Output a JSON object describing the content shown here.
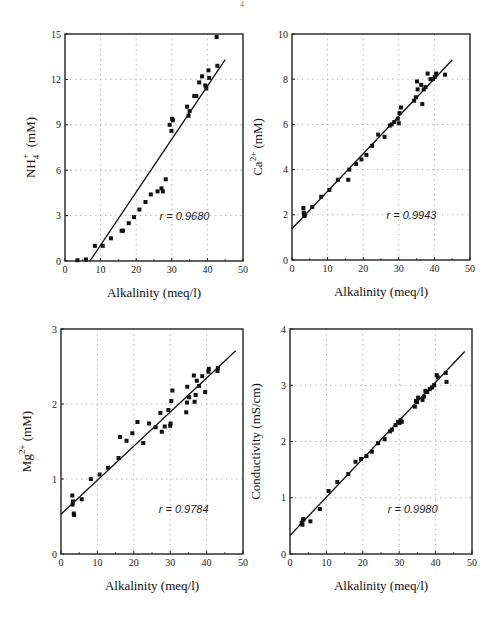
{
  "page_mark": "4",
  "chart_data": [
    {
      "id": "nh4",
      "type": "scatter",
      "title": "",
      "xlabel": "Alkalinity (meq/l)",
      "ylabel": "NH4+ (mM)",
      "ylabel_main": "NH",
      "ylabel_sub": "4",
      "ylabel_sup": "+",
      "ylabel_unit": "(mM)",
      "xlim": [
        0,
        50
      ],
      "ylim": [
        0,
        15
      ],
      "xticks": [
        0,
        10,
        20,
        30,
        40,
        50
      ],
      "yticks": [
        0,
        3,
        6,
        9,
        12,
        15
      ],
      "grid": true,
      "annotation": "r = 0.9680",
      "annotation_pos": [
        40,
        3
      ],
      "frame": {
        "left": 65,
        "top": 34,
        "right": 243,
        "bottom": 261
      },
      "fit_line": {
        "x": [
          7,
          45
        ],
        "y": [
          0,
          13.3
        ]
      },
      "x": [
        3.5,
        5.9,
        8.4,
        10.6,
        12.9,
        15.9,
        16.3,
        17.9,
        19.4,
        20.9,
        22.6,
        24.1,
        26.0,
        27.1,
        27.5,
        28.3,
        29.4,
        29.9,
        30.1,
        30.3,
        34.3,
        34.7,
        35.0,
        36.3,
        36.9,
        37.7,
        38.5,
        39.4,
        39.7,
        40.3,
        40.5,
        42.6,
        42.8
      ],
      "y": [
        0.05,
        0.1,
        1.0,
        1.0,
        1.5,
        2.0,
        2.0,
        2.5,
        2.9,
        3.4,
        3.9,
        4.4,
        4.6,
        4.8,
        4.6,
        5.4,
        9.0,
        8.6,
        9.4,
        9.3,
        10.2,
        9.6,
        9.9,
        10.9,
        10.9,
        11.8,
        12.2,
        11.6,
        11.4,
        12.6,
        12.1,
        14.8,
        12.9
      ]
    },
    {
      "id": "ca",
      "type": "scatter",
      "title": "",
      "xlabel": "Alkalinity (meq/l)",
      "ylabel": "Ca2+ (mM)",
      "ylabel_main": "Ca",
      "ylabel_sub": "",
      "ylabel_sup": "2+",
      "ylabel_unit": "(mM)",
      "xlim": [
        0,
        50
      ],
      "ylim": [
        0,
        10
      ],
      "xticks": [
        0,
        10,
        20,
        30,
        40,
        50
      ],
      "yticks": [
        0,
        2,
        4,
        6,
        8,
        10
      ],
      "grid": true,
      "annotation": "r = 0.9943",
      "annotation_pos": [
        40,
        2
      ],
      "frame": {
        "left": 292,
        "top": 34,
        "right": 470,
        "bottom": 260
      },
      "fit_line": {
        "x": [
          0,
          45
        ],
        "y": [
          1.38,
          8.85
        ]
      },
      "x": [
        3.2,
        3.3,
        3.4,
        3.5,
        3.6,
        5.7,
        8.2,
        10.5,
        12.9,
        15.8,
        16.1,
        18.0,
        19.5,
        20.9,
        22.5,
        24.2,
        26.0,
        27.5,
        28.0,
        28.7,
        29.7,
        30.0,
        30.2,
        30.6,
        34.3,
        34.8,
        35.1,
        35.3,
        36.3,
        36.6,
        37.0,
        37.5,
        38.1,
        38.9,
        39.6,
        40.1,
        40.5,
        43.0
      ],
      "y": [
        2.3,
        2.1,
        2.0,
        1.95,
        2.0,
        2.35,
        2.8,
        3.1,
        3.55,
        3.55,
        4.0,
        4.25,
        4.45,
        4.65,
        5.05,
        5.55,
        5.45,
        5.95,
        6.0,
        6.1,
        6.25,
        6.05,
        6.5,
        6.75,
        7.05,
        7.2,
        7.9,
        7.55,
        7.75,
        6.9,
        7.55,
        7.65,
        8.25,
        8.0,
        8.0,
        8.1,
        8.25,
        8.2
      ]
    },
    {
      "id": "mg",
      "type": "scatter",
      "title": "",
      "xlabel": "Alkalinity (meq/l)",
      "ylabel": "Mg2+ (mM)",
      "ylabel_main": "Mg",
      "ylabel_sub": "",
      "ylabel_sup": "2+",
      "ylabel_unit": "(mM)",
      "xlim": [
        0,
        50
      ],
      "ylim": [
        0,
        3
      ],
      "xticks": [
        0,
        10,
        20,
        30,
        40,
        50
      ],
      "yticks": [
        0,
        1,
        2,
        3
      ],
      "grid": true,
      "annotation": "r = 0.9784",
      "annotation_pos": [
        40,
        0.6
      ],
      "frame": {
        "left": 61,
        "top": 329,
        "right": 243,
        "bottom": 554
      },
      "fit_line": {
        "x": [
          0,
          48
        ],
        "y": [
          0.53,
          2.71
        ]
      },
      "x": [
        3.1,
        3.2,
        3.3,
        3.5,
        3.6,
        5.7,
        8.2,
        10.6,
        12.9,
        15.8,
        16.2,
        18.0,
        19.6,
        21.0,
        22.6,
        24.2,
        26.0,
        27.3,
        27.7,
        28.5,
        29.5,
        30.0,
        30.1,
        30.3,
        30.6,
        34.4,
        34.6,
        34.7,
        35.2,
        36.5,
        36.7,
        37.0,
        37.3,
        37.9,
        38.8,
        39.6,
        40.5,
        40.6,
        43.0,
        43.1
      ],
      "y": [
        0.78,
        0.66,
        0.7,
        0.54,
        0.52,
        0.73,
        1.0,
        1.06,
        1.15,
        1.28,
        1.56,
        1.51,
        1.61,
        1.76,
        1.48,
        1.74,
        1.69,
        1.88,
        1.63,
        1.7,
        1.92,
        1.71,
        1.74,
        2.04,
        2.18,
        1.89,
        2.02,
        2.23,
        2.09,
        2.38,
        2.03,
        2.12,
        2.31,
        2.24,
        2.37,
        2.16,
        2.43,
        2.47,
        2.44,
        2.48
      ]
    },
    {
      "id": "conductivity",
      "type": "scatter",
      "title": "",
      "xlabel": "Alkalinity (meq/l)",
      "ylabel": "Conductivity (mS/cm)",
      "ylabel_main": "Conductivity (mS/cm)",
      "ylabel_sub": "",
      "ylabel_sup": "",
      "ylabel_unit": "",
      "xlim": [
        0,
        50
      ],
      "ylim": [
        0,
        4
      ],
      "xticks": [
        0,
        10,
        20,
        30,
        40,
        50
      ],
      "yticks": [
        0,
        1,
        2,
        3,
        4
      ],
      "grid": true,
      "annotation": "r = 0.9980",
      "annotation_pos": [
        40,
        0.8
      ],
      "frame": {
        "left": 290,
        "top": 329,
        "right": 472,
        "bottom": 554
      },
      "fit_line": {
        "x": [
          0,
          48
        ],
        "y": [
          0.33,
          3.6
        ]
      },
      "x": [
        3.2,
        3.4,
        3.5,
        3.7,
        5.6,
        8.2,
        10.6,
        13.0,
        16.0,
        18.0,
        19.5,
        21.0,
        22.5,
        24.2,
        26.0,
        27.5,
        28.0,
        29.0,
        29.7,
        30.1,
        30.4,
        30.7,
        34.3,
        34.6,
        34.9,
        35.2,
        36.4,
        36.8,
        37.2,
        37.7,
        38.4,
        39.0,
        39.6,
        40.3,
        40.6,
        42.8,
        43.0
      ],
      "y": [
        0.55,
        0.52,
        0.6,
        0.62,
        0.58,
        0.8,
        1.12,
        1.28,
        1.42,
        1.64,
        1.69,
        1.74,
        1.82,
        1.97,
        2.04,
        2.18,
        2.21,
        2.29,
        2.35,
        2.33,
        2.38,
        2.35,
        2.62,
        2.72,
        2.7,
        2.78,
        2.74,
        2.8,
        2.9,
        2.88,
        2.93,
        2.96,
        3.0,
        3.18,
        3.14,
        3.22,
        3.06
      ]
    }
  ]
}
